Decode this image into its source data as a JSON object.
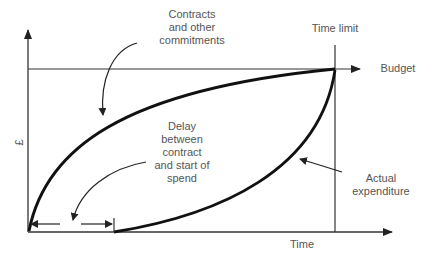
{
  "diagram": {
    "title": "",
    "axes": {
      "y_label": "£",
      "x_label": "Time"
    },
    "lines": {
      "budget_label": "Budget",
      "time_limit_label": "Time limit"
    },
    "curves": [
      {
        "name": "Contracts and other commitments",
        "shape": "concave-rising from origin to budget at time limit"
      },
      {
        "name": "Actual expenditure",
        "shape": "convex-rising from end of delay to budget at time limit"
      }
    ],
    "annotations": {
      "commitments": "Contracts\nand other\ncommitments",
      "delay": "Delay\nbetween\ncontract\nand start of\nspend",
      "actual": "Actual\nexpenditure"
    },
    "colors": {
      "line": "#222222",
      "curve": "#111111",
      "text": "#555555"
    }
  }
}
